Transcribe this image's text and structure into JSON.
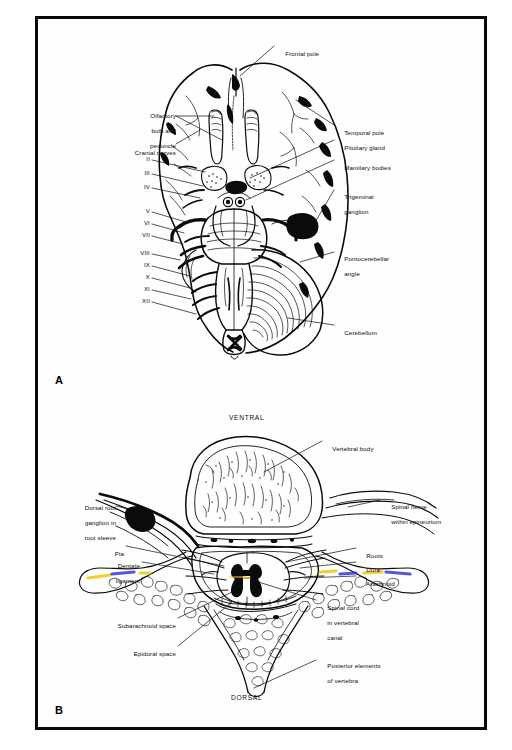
{
  "figure": {
    "panels": [
      {
        "id": "A",
        "letter": "A",
        "subject": "Ventral surface of the brain"
      },
      {
        "id": "B",
        "letter": "B",
        "subject": "Transverse section of vertebra and spinal cord"
      }
    ]
  },
  "panel_a": {
    "letter": "A",
    "labels_left": [
      {
        "name": "olfactory-bulb-and-peduncle",
        "lines": [
          "Olfactory",
          "bulb and",
          "peduncle"
        ]
      },
      {
        "name": "cranial-nerves",
        "lines": [
          "Cranial nerves"
        ]
      }
    ],
    "cranial_nerve_numerals": [
      "II",
      "III",
      "IV",
      "V",
      "VI",
      "VII",
      "VIII",
      "IX",
      "X",
      "XI",
      "XII"
    ],
    "labels_right": [
      {
        "name": "frontal-pole",
        "lines": [
          "Frontal pole"
        ]
      },
      {
        "name": "temporal-pole",
        "lines": [
          "Temporal pole"
        ]
      },
      {
        "name": "pituitary-gland",
        "lines": [
          "Pituitary gland"
        ]
      },
      {
        "name": "mamilary-bodies",
        "lines": [
          "Mamilary bodies"
        ]
      },
      {
        "name": "trigeminal-ganglion",
        "lines": [
          "Trigeminal",
          "ganglion"
        ]
      },
      {
        "name": "pontocerebellar-angle",
        "lines": [
          "Pontocerebellar",
          "angle"
        ]
      },
      {
        "name": "cerebellum",
        "lines": [
          "Cerebellum"
        ]
      }
    ]
  },
  "panel_b": {
    "letter": "B",
    "orientation_top": "VENTRAL",
    "orientation_bottom": "DORSAL",
    "labels_left": [
      {
        "name": "dorsal-root-ganglion",
        "lines": [
          "Dorsal root",
          "ganglion in",
          "root sleeve"
        ]
      },
      {
        "name": "pia",
        "lines": [
          "Pia"
        ]
      },
      {
        "name": "dentate-ligament",
        "lines": [
          "Dentate",
          "ligament"
        ]
      },
      {
        "name": "subarachnoid-space",
        "lines": [
          "Subarachnoid space"
        ]
      },
      {
        "name": "epidural-space",
        "lines": [
          "Epidural space"
        ]
      }
    ],
    "labels_right": [
      {
        "name": "vertebral-body",
        "lines": [
          "Vertebral body"
        ]
      },
      {
        "name": "spinal-nerve-within-epineurium",
        "lines": [
          "Spinal nerve",
          "within epineurium"
        ]
      },
      {
        "name": "roots",
        "lines": [
          "Roots"
        ]
      },
      {
        "name": "dura",
        "lines": [
          "Dura"
        ]
      },
      {
        "name": "arachnoid",
        "lines": [
          "Arachnoid"
        ]
      },
      {
        "name": "spinal-cord-in-vertebral-canal",
        "lines": [
          "Spinal cord",
          "in vertebral",
          "canal"
        ]
      },
      {
        "name": "posterior-elements-of-vertebra",
        "lines": [
          "Posterior elements",
          "of vertebra"
        ]
      }
    ]
  },
  "colors": {
    "ink": "#0b0b0b",
    "frame": "#0a0a0a",
    "paper": "#fefefe",
    "highlight_yellow": "#f2c40c",
    "highlight_blue": "#2a2ad6"
  }
}
